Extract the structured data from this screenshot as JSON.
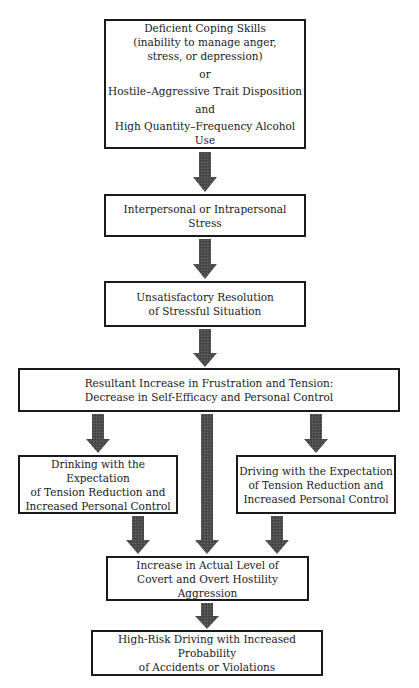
{
  "diagram": {
    "type": "flowchart",
    "nodes": {
      "coping": {
        "lines": [
          "Deficient Coping Skills",
          "(inability to manage anger,",
          "stress, or depression)"
        ],
        "or": "or",
        "trait": "Hostile–Aggressive Trait Disposition",
        "and": "and",
        "alcohol": "High Quantity–Frequency Alcohol Use"
      },
      "stress": {
        "lines": [
          "Interpersonal or Intrapersonal Stress"
        ]
      },
      "resolution": {
        "lines": [
          "Unsatisfactory Resolution",
          "of Stressful Situation"
        ]
      },
      "frustration": {
        "lines": [
          "Resultant Increase in Frustration and Tension:",
          "Decrease in Self-Efficacy and Personal Control"
        ]
      },
      "drinking": {
        "lines": [
          "Drinking with the Expectation",
          "of Tension Reduction and",
          "Increased Personal Control"
        ]
      },
      "driving": {
        "lines": [
          "Driving with the Expectation",
          "of Tension Reduction and",
          "Increased Personal Control"
        ]
      },
      "aggression": {
        "lines": [
          "Increase in Actual Level of",
          "Covert and Overt Hostility Aggression"
        ]
      },
      "highrisk": {
        "lines": [
          "High-Risk Driving with Increased Probability",
          "of Accidents or Violations"
        ]
      }
    },
    "edges": [
      [
        "coping",
        "stress"
      ],
      [
        "stress",
        "resolution"
      ],
      [
        "resolution",
        "frustration"
      ],
      [
        "frustration",
        "drinking"
      ],
      [
        "frustration",
        "driving"
      ],
      [
        "frustration",
        "aggression"
      ],
      [
        "drinking",
        "aggression"
      ],
      [
        "driving",
        "aggression"
      ],
      [
        "aggression",
        "highrisk"
      ]
    ],
    "colors": {
      "arrow": "#4a4a4a",
      "border": "#1a1a1a",
      "background": "#ffffff"
    }
  }
}
